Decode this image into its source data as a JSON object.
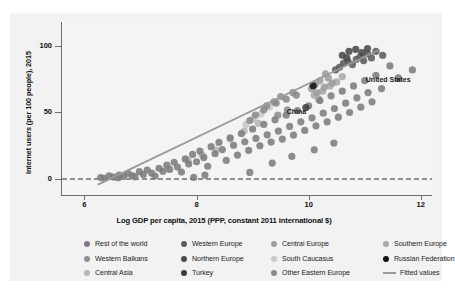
{
  "chart_data": {
    "type": "scatter",
    "title": "",
    "xlabel": "Log GDP per capita, 2015 (PPP, constant 2011 international $)",
    "ylabel": "Internet users (per 100 people), 2015",
    "xlim": [
      5.6,
      12.2
    ],
    "ylim": [
      -12,
      118
    ],
    "xticks": [
      6,
      8,
      10,
      12
    ],
    "yticks": [
      0,
      50,
      100
    ],
    "grid": false,
    "legend_position": "bottom",
    "reference_lines": [
      {
        "name": "zero-line",
        "axis": "y",
        "value": 0,
        "style": "dashed",
        "color": "#2b2b2b"
      }
    ],
    "fitted_line": {
      "name": "Fitted values",
      "color": "#9a9a9a",
      "x": [
        6.25,
        11.25
      ],
      "y": [
        -4,
        97
      ]
    },
    "annotations": [
      {
        "label": "United States",
        "x": 10.93,
        "y": 74.5
      },
      {
        "label": "China",
        "x": 9.52,
        "y": 50.0
      }
    ],
    "series": [
      {
        "name": "Rest of the world",
        "color": "#7d7d7d",
        "points": [
          [
            6.29,
            1.1
          ],
          [
            6.44,
            2.3
          ],
          [
            6.52,
            1.5
          ],
          [
            6.62,
            3.0
          ],
          [
            6.7,
            2.0
          ],
          [
            6.78,
            4.2
          ],
          [
            6.85,
            2.6
          ],
          [
            6.9,
            1.8
          ],
          [
            6.98,
            5.5
          ],
          [
            7.05,
            3.4
          ],
          [
            7.12,
            6.8
          ],
          [
            7.2,
            4.5
          ],
          [
            7.26,
            2.2
          ],
          [
            7.33,
            8.1
          ],
          [
            7.4,
            5.9
          ],
          [
            7.47,
            10.4
          ],
          [
            7.52,
            7.2
          ],
          [
            7.6,
            12.6
          ],
          [
            7.66,
            9.0
          ],
          [
            7.73,
            5.2
          ],
          [
            7.8,
            15.1
          ],
          [
            7.86,
            11.3
          ],
          [
            7.93,
            18.5
          ],
          [
            8.0,
            13.0
          ],
          [
            8.06,
            21.0
          ],
          [
            8.13,
            16.2
          ],
          [
            8.2,
            9.6
          ],
          [
            8.26,
            24.3
          ],
          [
            8.33,
            19.0
          ],
          [
            8.4,
            27.5
          ],
          [
            8.46,
            22.1
          ],
          [
            8.53,
            14.0
          ],
          [
            8.6,
            31.0
          ],
          [
            8.66,
            25.4
          ],
          [
            8.73,
            18.0
          ],
          [
            8.8,
            34.2
          ],
          [
            8.86,
            28.0
          ],
          [
            8.93,
            21.5
          ],
          [
            9.0,
            37.6
          ],
          [
            9.06,
            30.5
          ],
          [
            9.13,
            25.0
          ],
          [
            9.2,
            41.0
          ],
          [
            9.26,
            33.2
          ],
          [
            9.33,
            27.8
          ],
          [
            9.4,
            44.5
          ],
          [
            9.46,
            36.0
          ],
          [
            9.53,
            30.0
          ],
          [
            9.6,
            48.0
          ],
          [
            9.66,
            39.5
          ],
          [
            9.73,
            33.0
          ],
          [
            9.8,
            51.5
          ],
          [
            9.86,
            43.0
          ],
          [
            9.93,
            36.5
          ],
          [
            10.0,
            55.0
          ],
          [
            10.06,
            46.0
          ],
          [
            10.13,
            40.0
          ],
          [
            10.2,
            59.0
          ],
          [
            10.26,
            49.5
          ],
          [
            10.33,
            43.0
          ],
          [
            10.4,
            62.5
          ],
          [
            10.46,
            53.0
          ],
          [
            10.53,
            46.5
          ],
          [
            10.6,
            66.0
          ],
          [
            10.66,
            57.0
          ],
          [
            10.73,
            50.0
          ],
          [
            10.8,
            70.0
          ],
          [
            10.86,
            61.0
          ],
          [
            10.93,
            54.0
          ],
          [
            11.0,
            74.0
          ],
          [
            11.06,
            65.0
          ],
          [
            11.13,
            58.0
          ],
          [
            11.2,
            78.0
          ],
          [
            11.3,
            68.0
          ],
          [
            11.45,
            85.0
          ],
          [
            11.6,
            76.0
          ],
          [
            11.85,
            82.0
          ],
          [
            8.95,
            5.0
          ],
          [
            9.35,
            12.0
          ],
          [
            9.7,
            17.0
          ],
          [
            10.1,
            22.0
          ],
          [
            10.45,
            27.0
          ],
          [
            8.15,
            3.0
          ],
          [
            7.95,
            1.2
          ],
          [
            6.6,
            0.9
          ],
          [
            6.35,
            0.6
          ]
        ]
      },
      {
        "name": "Western Europe",
        "color": "#5c5c5c",
        "points": [
          [
            10.55,
            84.0
          ],
          [
            10.62,
            87.0
          ],
          [
            10.7,
            88.5
          ],
          [
            10.78,
            86.0
          ],
          [
            10.85,
            90.0
          ],
          [
            10.92,
            92.0
          ],
          [
            10.98,
            89.0
          ],
          [
            11.05,
            94.0
          ],
          [
            11.12,
            91.0
          ],
          [
            11.2,
            96.0
          ],
          [
            11.32,
            93.0
          ],
          [
            10.48,
            82.0
          ]
        ]
      },
      {
        "name": "Central Europe",
        "color": "#9d9d9d",
        "points": [
          [
            10.05,
            68.0
          ],
          [
            10.12,
            71.0
          ],
          [
            10.2,
            74.0
          ],
          [
            10.28,
            69.0
          ],
          [
            10.35,
            76.0
          ],
          [
            10.42,
            72.0
          ],
          [
            10.15,
            65.0
          ],
          [
            10.3,
            79.0
          ]
        ]
      },
      {
        "name": "Southern Europe",
        "color": "#a8a8a8",
        "points": [
          [
            10.1,
            63.0
          ],
          [
            10.25,
            66.0
          ],
          [
            10.38,
            70.0
          ],
          [
            10.5,
            73.0
          ],
          [
            10.6,
            77.0
          ],
          [
            10.18,
            60.0
          ]
        ]
      },
      {
        "name": "Western Balkans",
        "color": "#8e8e8e",
        "points": [
          [
            9.25,
            55.0
          ],
          [
            9.38,
            58.0
          ],
          [
            9.5,
            62.0
          ],
          [
            9.62,
            52.0
          ],
          [
            9.72,
            65.0
          ],
          [
            9.45,
            48.0
          ]
        ]
      },
      {
        "name": "Northern Europe",
        "color": "#4a4a4a",
        "points": [
          [
            10.6,
            93.0
          ],
          [
            10.72,
            96.0
          ],
          [
            10.84,
            97.5
          ],
          [
            10.95,
            95.0
          ],
          [
            11.05,
            98.0
          ],
          [
            10.68,
            91.0
          ]
        ]
      },
      {
        "name": "South Caucasus",
        "color": "#c8c8c8",
        "points": [
          [
            9.0,
            45.0
          ],
          [
            9.15,
            49.0
          ],
          [
            9.3,
            54.0
          ],
          [
            8.88,
            41.0
          ]
        ]
      },
      {
        "name": "Russian Federation",
        "color": "#141414",
        "points": [
          [
            10.08,
            70.1
          ]
        ]
      },
      {
        "name": "Central Asia",
        "color": "#b5b5b5",
        "points": [
          [
            8.1,
            18.0
          ],
          [
            8.35,
            22.0
          ],
          [
            8.6,
            30.0
          ],
          [
            8.85,
            36.0
          ],
          [
            9.1,
            42.0
          ],
          [
            7.85,
            14.0
          ]
        ]
      },
      {
        "name": "Turkey",
        "color": "#3d3d3d",
        "points": [
          [
            9.95,
            53.7
          ]
        ]
      },
      {
        "name": "Other Eastern Europe",
        "color": "#8a8a8a",
        "points": [
          [
            9.05,
            48.0
          ],
          [
            9.2,
            52.0
          ],
          [
            9.42,
            57.0
          ],
          [
            9.6,
            60.0
          ],
          [
            9.78,
            63.0
          ],
          [
            8.95,
            44.0
          ]
        ]
      }
    ]
  },
  "legend": {
    "columns": [
      {
        "items": [
          {
            "label": "Rest of the world",
            "color": "#7d7d7d",
            "marker": "dot"
          },
          {
            "label": "Western Balkans",
            "color": "#8e8e8e",
            "marker": "dot"
          },
          {
            "label": "Central Asia",
            "color": "#b5b5b5",
            "marker": "dot"
          }
        ]
      },
      {
        "items": [
          {
            "label": "Western Europe",
            "color": "#5c5c5c",
            "marker": "dot"
          },
          {
            "label": "Northern Europe",
            "color": "#4a4a4a",
            "marker": "dot"
          },
          {
            "label": "Turkey",
            "color": "#3d3d3d",
            "marker": "dot"
          }
        ]
      },
      {
        "items": [
          {
            "label": "Central Europe",
            "color": "#9d9d9d",
            "marker": "dot"
          },
          {
            "label": "South Caucasus",
            "color": "#c8c8c8",
            "marker": "dot"
          },
          {
            "label": "Other Eastern Europe",
            "color": "#8a8a8a",
            "marker": "dot"
          }
        ]
      },
      {
        "items": [
          {
            "label": "Southern Europe",
            "color": "#a8a8a8",
            "marker": "dot"
          },
          {
            "label": "Russian Federation",
            "color": "#141414",
            "marker": "dot"
          },
          {
            "label": "Fitted values",
            "color": "#9a9a9a",
            "marker": "line"
          }
        ]
      }
    ]
  }
}
